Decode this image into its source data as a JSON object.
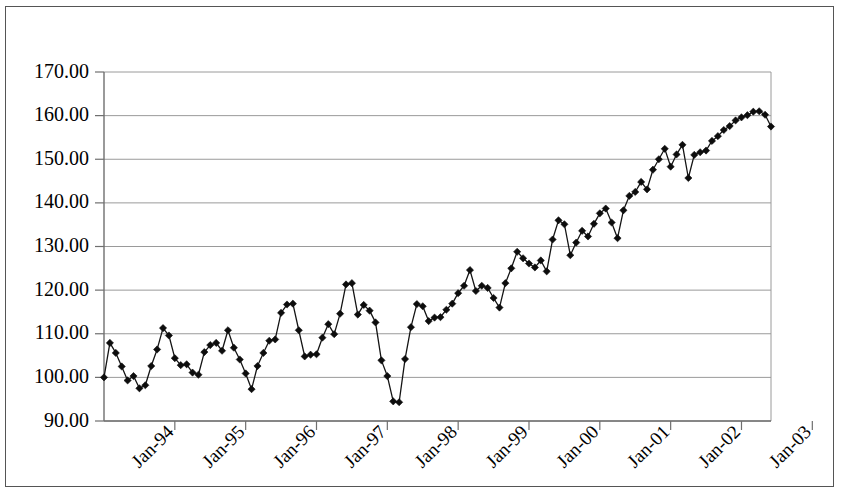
{
  "chart_data": {
    "type": "line",
    "title": "",
    "subtitle": "",
    "xlabel": "",
    "ylabel": "",
    "grid": true,
    "legend_position": "none",
    "marker": "diamond",
    "ylim": [
      90.0,
      170.0
    ],
    "ytick_step": 10.0,
    "ytick_labels": [
      "90.00",
      "100.00",
      "110.00",
      "120.00",
      "130.00",
      "140.00",
      "150.00",
      "160.00",
      "170.00"
    ],
    "ytick_values": [
      90.0,
      100.0,
      110.0,
      120.0,
      130.0,
      140.0,
      150.0,
      160.0,
      170.0
    ],
    "xtick_labels": [
      "Jan-94",
      "Jan-95",
      "Jan-96",
      "Jan-97",
      "Jan-98",
      "Jan-99",
      "Jan-00",
      "Jan-01",
      "Jan-02",
      "Jan-03",
      "Jan-04"
    ],
    "xtick_indices": [
      12,
      24,
      36,
      48,
      60,
      72,
      84,
      96,
      108,
      120,
      132
    ],
    "x_start_label": "Jan-93",
    "x_end_label": "Dec-04",
    "series": [
      {
        "name": "Index",
        "values": [
          100.0,
          107.9,
          105.6,
          102.5,
          99.3,
          100.3,
          97.5,
          98.2,
          102.6,
          106.4,
          111.3,
          109.6,
          104.4,
          102.8,
          103.0,
          101.1,
          100.6,
          105.8,
          107.4,
          107.9,
          106.1,
          110.8,
          106.8,
          104.1,
          100.9,
          97.3,
          102.6,
          105.6,
          108.4,
          108.7,
          114.8,
          116.7,
          116.9,
          110.8,
          104.8,
          105.2,
          105.3,
          109.1,
          112.2,
          109.9,
          114.6,
          121.3,
          121.6,
          114.4,
          116.6,
          115.3,
          112.6,
          103.9,
          100.3,
          94.5,
          94.3,
          104.2,
          111.5,
          116.8,
          116.3,
          112.9,
          113.7,
          113.8,
          115.5,
          116.9,
          119.3,
          121.0,
          124.6,
          119.8,
          121.0,
          120.5,
          118.2,
          116.0,
          121.6,
          125.0,
          128.8,
          127.3,
          126.1,
          125.2,
          126.8,
          124.3,
          131.6,
          136.0,
          135.1,
          128.0,
          130.9,
          133.6,
          132.3,
          135.2,
          137.6,
          138.7,
          135.5,
          131.9,
          138.3,
          141.6,
          142.5,
          144.8,
          143.1,
          147.6,
          150.0,
          152.4,
          148.3,
          151.1,
          153.3,
          145.7,
          151.0,
          151.6,
          152.0,
          154.2,
          155.3,
          156.7,
          157.6,
          158.9,
          159.6,
          160.1,
          160.9,
          161.0,
          160.2,
          157.5
        ]
      }
    ]
  }
}
